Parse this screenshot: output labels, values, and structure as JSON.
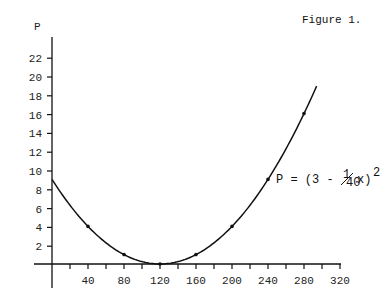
{
  "figure_label": "Figure 1.",
  "y_axis_label": "P",
  "equation": {
    "prefix": "P = (3 - ",
    "frac_num": "1",
    "frac_den": "40",
    "suffix": "x)",
    "exponent": "2"
  },
  "chart_data": {
    "type": "line",
    "title": "Figure 1.",
    "xlabel": "",
    "ylabel": "P",
    "function": "P = (3 - x/40)^2",
    "x_ticks": [
      40,
      80,
      120,
      160,
      200,
      240,
      280,
      320
    ],
    "x_minor_tick_step": 20,
    "y_ticks": [
      2,
      4,
      6,
      8,
      10,
      12,
      14,
      16,
      18,
      20,
      22
    ],
    "xlim": [
      0,
      320
    ],
    "ylim": [
      0,
      23
    ],
    "grid": false,
    "series": [
      {
        "name": "P = (3 - 1/40 x)^2",
        "x": [
          0,
          40,
          80,
          120,
          160,
          200,
          240,
          280,
          295
        ],
        "values": [
          9,
          4,
          1,
          0,
          1,
          4,
          9,
          16,
          19.5
        ]
      }
    ],
    "marked_points": [
      {
        "x": 40,
        "y": 4
      },
      {
        "x": 80,
        "y": 1
      },
      {
        "x": 120,
        "y": 0
      },
      {
        "x": 160,
        "y": 1
      },
      {
        "x": 200,
        "y": 4
      },
      {
        "x": 240,
        "y": 9
      },
      {
        "x": 280,
        "y": 16
      }
    ],
    "curve_x_range": [
      0,
      295
    ]
  }
}
